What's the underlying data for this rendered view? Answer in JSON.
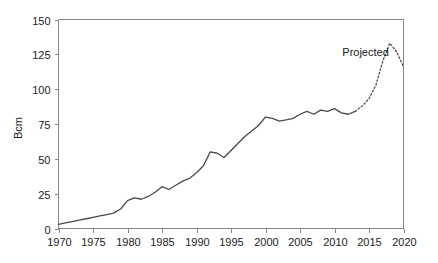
{
  "chart_data": {
    "type": "line",
    "title": "",
    "xlabel": "",
    "ylabel": "Bcm",
    "xlim": [
      1970,
      2020
    ],
    "ylim": [
      0,
      150
    ],
    "xticks": [
      1970,
      1975,
      1980,
      1985,
      1990,
      1995,
      2000,
      2005,
      2010,
      2015,
      2020
    ],
    "yticks": [
      0,
      25,
      50,
      75,
      100,
      125,
      150
    ],
    "grid": false,
    "legend": null,
    "annotations": [
      {
        "text": "Projected",
        "x": 2014.5,
        "y": 124
      }
    ],
    "series": [
      {
        "name": "Historical",
        "style": "solid",
        "x": [
          1970,
          1971,
          1972,
          1973,
          1974,
          1975,
          1976,
          1977,
          1978,
          1979,
          1980,
          1981,
          1982,
          1983,
          1984,
          1985,
          1986,
          1987,
          1988,
          1989,
          1990,
          1991,
          1992,
          1993,
          1994,
          1995,
          1996,
          1997,
          1998,
          1999,
          2000,
          2001,
          2002,
          2003,
          2004,
          2005,
          2006,
          2007,
          2008,
          2009,
          2010,
          2011,
          2012,
          2013
        ],
        "values": [
          3,
          4,
          5,
          6,
          7,
          8,
          9,
          10,
          11,
          14,
          20,
          22,
          21,
          23,
          26,
          30,
          28,
          31,
          34,
          36,
          40,
          45,
          55,
          54,
          51,
          56,
          61,
          66,
          70,
          74,
          80,
          79,
          77,
          78,
          79,
          82,
          84,
          82,
          85,
          84,
          86,
          83,
          82,
          84
        ]
      },
      {
        "name": "Projected",
        "style": "dotted",
        "x": [
          2013,
          2014,
          2015,
          2016,
          2017,
          2018,
          2019,
          2020
        ],
        "values": [
          84,
          88,
          93,
          103,
          120,
          133,
          127,
          116
        ]
      }
    ]
  },
  "axis": {
    "y_label": "Bcm"
  }
}
